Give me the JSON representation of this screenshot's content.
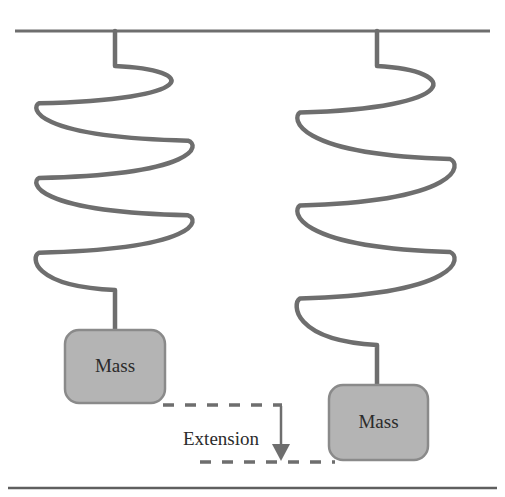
{
  "figure": {
    "background_color": "#ffffff",
    "stroke_color": "#6e6e6e",
    "box_fill_color": "#b4b4b4",
    "box_stroke_color": "#8a8a8a",
    "text_color": "#2b2b2b",
    "rule_color": "#5f5f5f"
  },
  "ceiling": {
    "name": "support-ceiling-line",
    "x1": 15,
    "x2": 490,
    "y": 31
  },
  "bottom_rule": {
    "name": "bottom-rule",
    "x1": 8,
    "x2": 497,
    "y": 488
  },
  "springs": [
    {
      "id": "left-spring",
      "label": "unstretched spring",
      "anchor_x": 115,
      "top_y": 31,
      "coil_start_y": 66,
      "coil_end_y": 290,
      "bottom_y": 330,
      "left_x": 45,
      "right_x": 186,
      "coils": 3,
      "state": "relaxed"
    },
    {
      "id": "right-spring",
      "label": "stretched spring",
      "anchor_x": 377,
      "top_y": 31,
      "coil_start_y": 66,
      "coil_end_y": 345,
      "bottom_y": 385,
      "left_x": 306,
      "right_x": 448,
      "coils": 3,
      "state": "extended"
    }
  ],
  "masses": [
    {
      "id": "left-mass",
      "label": "Mass",
      "x": 65,
      "y": 330,
      "width": 100,
      "height": 73,
      "radius": 14
    },
    {
      "id": "right-mass",
      "label": "Mass",
      "x": 329,
      "y": 385,
      "width": 99,
      "height": 75,
      "radius": 14
    }
  ],
  "extension": {
    "label": "Extension",
    "label_x": 221,
    "label_y": 441,
    "top_dashed_line": {
      "x1": 163,
      "x2": 282,
      "y": 405
    },
    "bottom_dashed_line": {
      "x1": 200,
      "x2": 335,
      "y": 462
    },
    "arrow": {
      "x": 281,
      "y_start": 406,
      "y_end": 461
    },
    "dash_pattern": "11 11"
  }
}
